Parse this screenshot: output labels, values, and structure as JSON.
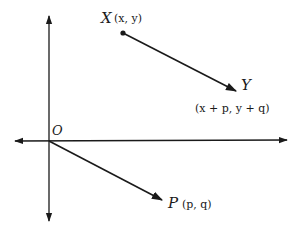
{
  "diagram": {
    "type": "vector-translation",
    "axes": {
      "origin_label": "O",
      "x_axis": {
        "bidirectional": true
      },
      "y_axis": {
        "bidirectional": true
      }
    },
    "points": {
      "X": {
        "name": "X",
        "coords": "(x, y)"
      },
      "Y": {
        "name": "Y",
        "coords": "(x + p, y + q)"
      },
      "P": {
        "name": "P",
        "coords": "(p, q)"
      }
    },
    "vectors": [
      {
        "from": "X",
        "to": "Y"
      },
      {
        "from": "O",
        "to": "P"
      }
    ],
    "colors": {
      "ink": "#1a1a1a",
      "background": "#ffffff"
    }
  }
}
